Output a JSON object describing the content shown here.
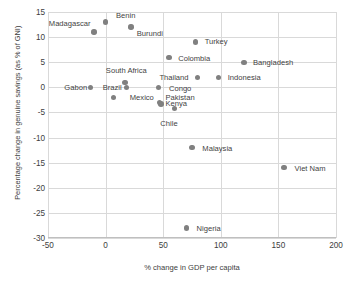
{
  "chart_data": {
    "type": "scatter",
    "title": "",
    "xlabel": "% change in GDP per capita",
    "ylabel": "Percentage change in genuine savings (as % of GNI)",
    "xlim": [
      -50,
      200
    ],
    "ylim": [
      -30,
      15
    ],
    "xticks": [
      "-50",
      "0",
      "50",
      "100",
      "150",
      "200"
    ],
    "yticks": [
      "15",
      "10",
      "5",
      "0",
      "-5",
      "-10",
      "-15",
      "-20",
      "-25",
      "-30"
    ],
    "grid": true,
    "legend": "none",
    "marker_color": "#808080",
    "points": [
      {
        "label": "Madagascar",
        "x": -10,
        "y": 11,
        "anchor": "left",
        "lx": -13,
        "ly": 12.6
      },
      {
        "label": "Benin",
        "x": 0,
        "y": 13,
        "anchor": "right",
        "lx": 9,
        "ly": 14.3
      },
      {
        "label": "Burundi",
        "x": 22,
        "y": 12,
        "anchor": "right",
        "lx": 27,
        "ly": 10.7
      },
      {
        "label": "Turkey",
        "x": 78,
        "y": 9,
        "anchor": "right",
        "lx": 86,
        "ly": 9.0
      },
      {
        "label": "Colombia",
        "x": 55,
        "y": 6,
        "anchor": "right",
        "lx": 63,
        "ly": 5.6
      },
      {
        "label": "Bangladesh",
        "x": 120,
        "y": 5,
        "anchor": "right",
        "lx": 128,
        "ly": 4.8
      },
      {
        "label": "South Africa",
        "x": 17,
        "y": 1,
        "anchor": "center",
        "lx": 18,
        "ly": 3.2
      },
      {
        "label": "Thailand",
        "x": 80,
        "y": 2,
        "anchor": "left",
        "lx": 72,
        "ly": 1.9
      },
      {
        "label": "Indonesia",
        "x": 98,
        "y": 2,
        "anchor": "right",
        "lx": 106,
        "ly": 1.9
      },
      {
        "label": "Gabon",
        "x": -13,
        "y": 0,
        "anchor": "left",
        "lx": -16,
        "ly": -0.1
      },
      {
        "label": "Brazil",
        "x": 18,
        "y": 0,
        "anchor": "left",
        "lx": 14,
        "ly": -0.1
      },
      {
        "label": "Mexico",
        "x": 7,
        "y": -2,
        "anchor": "right",
        "lx": 21,
        "ly": -2.1
      },
      {
        "label": "Congo",
        "x": 46,
        "y": 0,
        "anchor": "right",
        "lx": 55,
        "ly": -0.4
      },
      {
        "label": "Pakistan",
        "x": 47,
        "y": -3,
        "anchor": "right",
        "lx": 52,
        "ly": -2.2
      },
      {
        "label": "Kenya",
        "x": 48,
        "y": -3.3,
        "anchor": "right",
        "lx": 52,
        "ly": -3.3
      },
      {
        "label": "Chile",
        "x": 60,
        "y": -4.2,
        "anchor": "center",
        "lx": 55,
        "ly": -7.4
      },
      {
        "label": "Malaysia",
        "x": 75,
        "y": -12,
        "anchor": "right",
        "lx": 84,
        "ly": -12.2
      },
      {
        "label": "Viet Nam",
        "x": 155,
        "y": -16,
        "anchor": "right",
        "lx": 164,
        "ly": -16.2
      },
      {
        "label": "Nigeria",
        "x": 70,
        "y": -28,
        "anchor": "right",
        "lx": 79,
        "ly": -28.2
      }
    ]
  }
}
